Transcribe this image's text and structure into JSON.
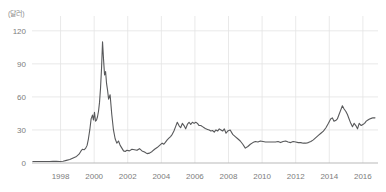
{
  "unit_label": "(달러)",
  "chart_data": {
    "type": "line",
    "title": "",
    "subtitle": "",
    "xlabel": "",
    "ylabel": "(달러)",
    "ylim": [
      0,
      128
    ],
    "xlim": [
      1996.3,
      2016.9
    ],
    "yticks": [
      0,
      30,
      60,
      90,
      120
    ],
    "ytick_labels": [
      "0",
      "30",
      "60",
      "90",
      "120"
    ],
    "xticks": [
      1998,
      2000,
      2002,
      2004,
      2006,
      2008,
      2010,
      2012,
      2014,
      2016
    ],
    "xtick_labels": [
      "1998",
      "2000",
      "2002",
      "2004",
      "2006",
      "2008",
      "2010",
      "2012",
      "2014",
      "2016"
    ],
    "grid": true,
    "grid_color": "#e3e3e3",
    "legend": null,
    "line_color": "#58595b",
    "line_width": 1.1,
    "series": [
      {
        "name": "price",
        "x": [
          1996.35,
          1996.55,
          1996.75,
          1996.95,
          1997.15,
          1997.35,
          1997.55,
          1997.75,
          1997.95,
          1998.15,
          1998.35,
          1998.55,
          1998.75,
          1998.95,
          1999.1,
          1999.2,
          1999.3,
          1999.4,
          1999.5,
          1999.58,
          1999.66,
          1999.74,
          1999.82,
          1999.9,
          1999.96,
          2000.02,
          2000.08,
          2000.14,
          2000.2,
          2000.26,
          2000.32,
          2000.38,
          2000.44,
          2000.5,
          2000.56,
          2000.62,
          2000.68,
          2000.74,
          2000.8,
          2000.86,
          2000.95,
          2001.05,
          2001.15,
          2001.25,
          2001.35,
          2001.45,
          2001.55,
          2001.65,
          2001.75,
          2001.85,
          2001.95,
          2002.1,
          2002.25,
          2002.4,
          2002.55,
          2002.7,
          2002.85,
          2003.0,
          2003.15,
          2003.3,
          2003.45,
          2003.6,
          2003.75,
          2003.9,
          2004.05,
          2004.15,
          2004.25,
          2004.35,
          2004.45,
          2004.55,
          2004.65,
          2004.75,
          2004.85,
          2004.95,
          2005.05,
          2005.15,
          2005.25,
          2005.35,
          2005.45,
          2005.55,
          2005.65,
          2005.75,
          2005.85,
          2005.95,
          2006.05,
          2006.15,
          2006.25,
          2006.35,
          2006.45,
          2006.55,
          2006.65,
          2006.75,
          2006.85,
          2006.95,
          2007.05,
          2007.15,
          2007.25,
          2007.35,
          2007.45,
          2007.55,
          2007.65,
          2007.75,
          2007.85,
          2007.95,
          2008.1,
          2008.25,
          2008.4,
          2008.55,
          2008.7,
          2008.85,
          2009.0,
          2009.15,
          2009.3,
          2009.45,
          2009.6,
          2009.75,
          2009.9,
          2010.05,
          2010.2,
          2010.35,
          2010.5,
          2010.65,
          2010.8,
          2010.95,
          2011.1,
          2011.25,
          2011.4,
          2011.55,
          2011.7,
          2011.85,
          2012.0,
          2012.15,
          2012.3,
          2012.45,
          2012.6,
          2012.75,
          2012.9,
          2013.05,
          2013.2,
          2013.35,
          2013.5,
          2013.65,
          2013.8,
          2013.95,
          2014.08,
          2014.18,
          2014.28,
          2014.38,
          2014.48,
          2014.58,
          2014.68,
          2014.78,
          2014.88,
          2014.98,
          2015.08,
          2015.18,
          2015.28,
          2015.38,
          2015.48,
          2015.58,
          2015.68,
          2015.78,
          2015.9,
          2016.0,
          2016.1,
          2016.2,
          2016.3,
          2016.4,
          2016.5,
          2016.6,
          2016.72
        ],
        "y": [
          1.3,
          1.3,
          1.3,
          1.3,
          1.4,
          1.4,
          1.5,
          1.5,
          1.3,
          1.6,
          2.4,
          3.2,
          4.6,
          6.0,
          8.0,
          10.5,
          12.5,
          12.0,
          13.5,
          16.0,
          22.0,
          30.0,
          40.0,
          43.5,
          39.0,
          46.0,
          38.0,
          39.0,
          42.0,
          47.0,
          55.0,
          68.0,
          86.0,
          110.0,
          94.0,
          80.0,
          83.0,
          72.0,
          66.0,
          58.0,
          62.0,
          44.0,
          30.0,
          22.0,
          18.0,
          20.0,
          16.0,
          13.5,
          11.0,
          10.5,
          11.5,
          11.0,
          12.5,
          12.0,
          11.5,
          13.0,
          11.0,
          10.0,
          8.5,
          9.0,
          10.5,
          12.5,
          14.0,
          16.0,
          18.0,
          17.0,
          19.0,
          21.0,
          22.5,
          24.0,
          26.0,
          29.0,
          33.0,
          37.0,
          34.0,
          32.0,
          36.0,
          34.0,
          31.0,
          35.0,
          37.0,
          35.0,
          37.0,
          36.0,
          37.0,
          36.0,
          34.0,
          34.0,
          33.0,
          32.0,
          31.0,
          30.5,
          30.0,
          29.0,
          29.5,
          28.0,
          30.0,
          29.0,
          31.0,
          30.0,
          29.0,
          31.0,
          27.0,
          29.0,
          30.0,
          26.0,
          24.0,
          22.0,
          20.0,
          17.0,
          13.5,
          15.0,
          17.0,
          18.5,
          19.5,
          19.0,
          20.0,
          19.5,
          19.0,
          19.0,
          19.0,
          19.0,
          19.0,
          19.5,
          18.5,
          19.5,
          20.0,
          19.0,
          18.5,
          19.5,
          19.0,
          18.5,
          18.5,
          18.0,
          18.0,
          18.5,
          19.5,
          21.0,
          23.0,
          25.0,
          27.0,
          29.0,
          32.0,
          36.0,
          40.0,
          41.0,
          38.0,
          38.5,
          40.0,
          44.0,
          48.0,
          52.0,
          49.0,
          47.0,
          44.0,
          40.0,
          36.0,
          33.0,
          36.0,
          34.0,
          31.0,
          36.0,
          34.0,
          35.0,
          36.0,
          38.0,
          39.0,
          40.0,
          40.5,
          41.0,
          41.0
        ]
      }
    ]
  }
}
